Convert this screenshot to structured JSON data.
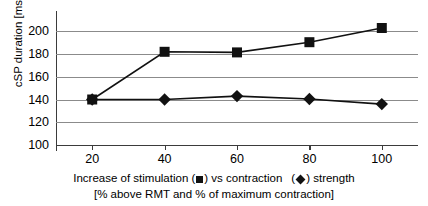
{
  "chart_data": {
    "type": "line",
    "title": "",
    "subtitle": "",
    "xlabel": "Increase of stimulation (■) vs contraction (◆) strength [% above RMT and % of maximum contraction]",
    "ylabel": "cSP duration [ms]",
    "x": [
      20,
      40,
      60,
      80,
      100
    ],
    "xlim": [
      10,
      110
    ],
    "ylim": [
      100,
      210
    ],
    "xtick_labels": [
      "20",
      "40",
      "60",
      "80",
      "100"
    ],
    "ytick_labels": [
      "100",
      "120",
      "140",
      "160",
      "180",
      "200"
    ],
    "yticks": [
      100,
      120,
      140,
      160,
      180,
      200
    ],
    "grid": "horizontal",
    "legend_position": "below-axis-inline",
    "series": [
      {
        "name": "Increase of stimulation",
        "marker": "square",
        "color": "#111111",
        "values": [
          140,
          182,
          181.5,
          190.5,
          203
        ]
      },
      {
        "name": "Contraction strength",
        "marker": "diamond",
        "color": "#111111",
        "values": [
          140,
          140,
          143,
          140.5,
          136
        ]
      }
    ]
  },
  "axes": {
    "y_title": "cSP duration [ms]",
    "x_caption_line1_a": "Increase of stimulation (",
    "x_caption_line1_b": ") vs contraction",
    "x_caption_line1_c": ") strength",
    "x_caption_line2": "[% above RMT and % of maximum contraction]"
  },
  "legend": {
    "stimulation_marker_name": "square-marker",
    "contraction_marker_name": "diamond-marker"
  }
}
